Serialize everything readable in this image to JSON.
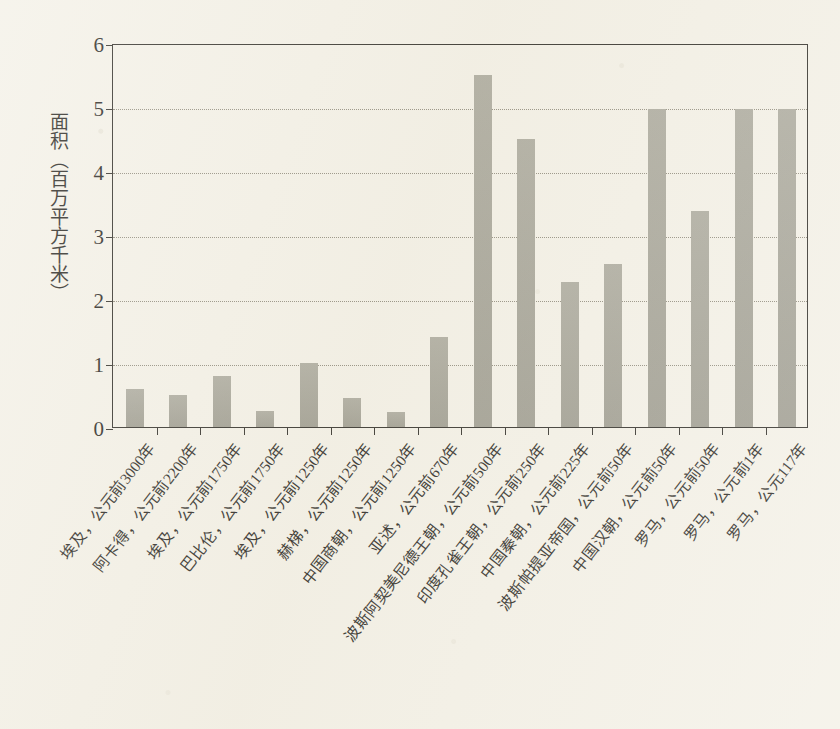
{
  "chart_data": {
    "type": "bar",
    "title": "",
    "xlabel": "",
    "ylabel": "面积（百万平方千米）",
    "ylim": [
      0,
      6
    ],
    "yticks": [
      0,
      1,
      2,
      3,
      4,
      5,
      6
    ],
    "ytick_labels": [
      "0",
      "1",
      "2",
      "3",
      "4",
      "5",
      "6"
    ],
    "grid": "horizontal-dotted",
    "legend": "none",
    "bar_color": "#a2a093",
    "axis_color": "#26241e",
    "background_color": "#f3f0e6",
    "categories": [
      "埃及，公元前3000年",
      "阿卡得，公元前2200年",
      "埃及，公元前1750年",
      "巴比伦，公元前1750年",
      "埃及，公元前1250年",
      "赫梯，公元前1250年",
      "中国商朝，公元前1250年",
      "亚述，公元前670年",
      "波斯阿契美尼德王朝，公元前500年",
      "印度孔雀王朝，公元前250年",
      "中国秦朝，公元前225年",
      "波斯帕提亚帝国，公元前50年",
      "中国汉朝，公元前50年",
      "罗马，公元前50年",
      "罗马，公元前1年",
      "罗马，公元117年"
    ],
    "values": [
      0.6,
      0.5,
      0.8,
      0.25,
      1.0,
      0.45,
      0.24,
      1.4,
      5.5,
      4.5,
      2.27,
      2.55,
      4.97,
      3.38,
      4.97,
      4.97
    ],
    "values_note": "百万平方千米"
  }
}
